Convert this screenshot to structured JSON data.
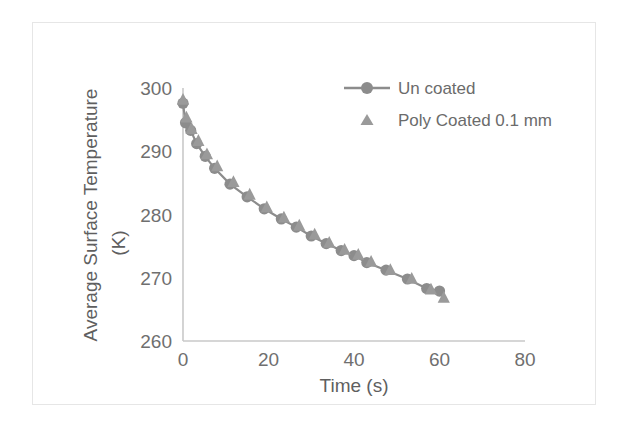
{
  "chart_data": {
    "type": "line",
    "title": "",
    "xlabel": "Time (s)",
    "ylabel": "Average Surface Temperature (K)",
    "ylabel_line1": "Average Surface Temperature",
    "ylabel_line2": "(K)",
    "xlim": [
      0,
      80
    ],
    "ylim": [
      260,
      300
    ],
    "xticks": [
      0,
      20,
      40,
      60,
      80
    ],
    "xtick_labels": [
      "0",
      "20",
      "40",
      "60",
      "80"
    ],
    "yticks": [
      260,
      270,
      280,
      290,
      300
    ],
    "ytick_labels": [
      "260",
      "270",
      "280",
      "290",
      "300"
    ],
    "grid": false,
    "legend_position": "top-right",
    "series": [
      {
        "name": "Un coated",
        "marker": "circle",
        "line": true,
        "color": "#8c8c8c",
        "x": [
          0.0,
          0.6,
          1.8,
          3.2,
          5.2,
          7.4,
          11.0,
          15.0,
          19.0,
          23.0,
          26.5,
          30.0,
          33.5,
          37.0,
          40.0,
          43.0,
          47.5,
          52.5,
          57.0,
          60.0
        ],
        "y": [
          297.6,
          294.5,
          293.3,
          291.2,
          289.2,
          287.3,
          284.8,
          282.8,
          280.9,
          279.3,
          278.0,
          276.6,
          275.4,
          274.3,
          273.5,
          272.4,
          271.2,
          269.8,
          268.3,
          267.9
        ]
      },
      {
        "name": "Poly Coated 0.1 mm",
        "marker": "triangle",
        "line": false,
        "color": "#9a9a9a",
        "x": [
          0.0,
          0.8,
          2.0,
          3.6,
          5.6,
          8.0,
          11.8,
          15.6,
          19.6,
          23.6,
          27.2,
          30.8,
          34.2,
          37.8,
          41.0,
          44.0,
          48.5,
          53.5,
          58.0,
          61.0
        ],
        "y": [
          298.2,
          295.4,
          293.6,
          291.7,
          289.6,
          287.7,
          285.2,
          283.2,
          281.2,
          279.6,
          278.3,
          276.9,
          275.6,
          274.5,
          273.7,
          272.6,
          271.3,
          269.9,
          268.2,
          266.9
        ]
      }
    ],
    "colors": {
      "marker": "#8c8c8c",
      "line": "#8c8c8c",
      "axis": "#c9c9c9",
      "tick_text": "#6f6f6f",
      "frame": "#e6e6e6"
    }
  }
}
